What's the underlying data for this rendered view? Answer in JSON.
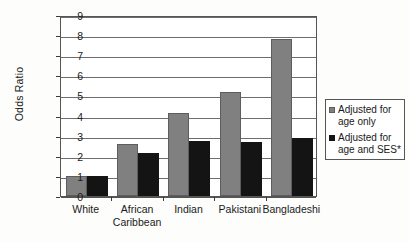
{
  "chart_data": {
    "type": "bar",
    "title": "",
    "xlabel": "",
    "ylabel": "Odds Ratio",
    "ylim": [
      0,
      9
    ],
    "ytick_labels": [
      "9",
      "8",
      "7",
      "6",
      "5",
      "4",
      "3",
      "2",
      "1",
      "0"
    ],
    "ytick_values": [
      9,
      8,
      7,
      6,
      5,
      4,
      3,
      2,
      1,
      0
    ],
    "grid": "horizontal",
    "legend_position": "right",
    "categories": [
      "White",
      "African\nCaribbean",
      "Indian",
      "Pakistani",
      "Bangladeshi"
    ],
    "series": [
      {
        "name": "Adjusted for age only",
        "color": "#808080",
        "values": [
          1.0,
          2.6,
          4.15,
          5.15,
          7.8
        ]
      },
      {
        "name": "Adjusted for age and SES*",
        "color": "#141414",
        "values": [
          1.0,
          2.15,
          2.75,
          2.7,
          2.9
        ]
      }
    ]
  },
  "legend": {
    "entries": [
      {
        "label": "Adjusted for age only",
        "swatch": "grey-square-icon"
      },
      {
        "label": "Adjusted for age and SES*",
        "swatch": "black-square-icon"
      }
    ]
  }
}
